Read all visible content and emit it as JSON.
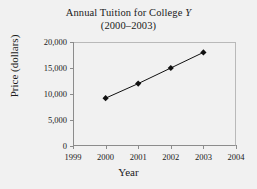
{
  "chart_data": {
    "type": "line",
    "title": "Annual Tuition for College Y",
    "subtitle": "(2000–2003)",
    "title_line1_prefix": "Annual Tuition for College ",
    "title_line1_italic": "Y",
    "xlabel": "Year",
    "ylabel": "Price (dollars)",
    "x": [
      2000,
      2001,
      2002,
      2003
    ],
    "values": [
      9200,
      12000,
      15000,
      18000
    ],
    "xlim": [
      1999,
      2004
    ],
    "ylim": [
      0,
      20000
    ],
    "xticks": [
      1999,
      2000,
      2001,
      2002,
      2003,
      2004
    ],
    "xtick_labels": [
      "1999",
      "2000",
      "2001",
      "2002",
      "2003",
      "2004"
    ],
    "yticks": [
      0,
      5000,
      10000,
      15000,
      20000
    ],
    "ytick_labels": [
      "0",
      "5,000",
      "10,000",
      "15,000",
      "20,000"
    ],
    "grid": false,
    "legend": null,
    "marker": "diamond",
    "marker_color": "#111111",
    "line_color": "#111111",
    "background_color": "#f1f1f1",
    "frame_color": "#8c8c8c",
    "points": [
      {
        "x": 2000,
        "y": 9200,
        "label": "2000"
      },
      {
        "x": 2001,
        "y": 12000,
        "label": "2001"
      },
      {
        "x": 2002,
        "y": 15000,
        "label": "2002"
      },
      {
        "x": 2003,
        "y": 18000,
        "label": "2003"
      }
    ]
  }
}
